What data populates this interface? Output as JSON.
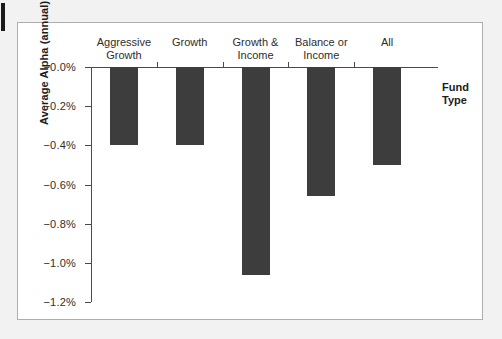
{
  "figure": {
    "y_axis_title": "Average Alpha (annual)",
    "x_axis_title": "Fund\nType"
  },
  "chart_data": {
    "type": "bar",
    "title": "",
    "subtitle": "",
    "xlabel": "Fund Type",
    "ylabel": "Average Alpha (annual)",
    "orientation": "vertical-downward",
    "baseline": 0.0,
    "grid": false,
    "legend": null,
    "bar_color": "#3d3d3d",
    "axis_color": "#4a4a4a",
    "categories": [
      "Aggressive Growth",
      "Growth",
      "Growth & Income",
      "Balance or Income",
      "All"
    ],
    "category_labels_wrapped": [
      "Aggressive\nGrowth",
      "Growth",
      "Growth &\nIncome",
      "Balance or\nIncome",
      "All"
    ],
    "values": [
      -0.4,
      -0.4,
      -1.06,
      -0.66,
      -0.5
    ],
    "value_unit": "percent",
    "ylim": [
      -1.2,
      0.0
    ],
    "ytick_values": [
      0.0,
      -0.2,
      -0.4,
      -0.6,
      -0.8,
      -1.0,
      -1.2
    ],
    "ytick_labels": [
      "−0.0%",
      "−0.2%",
      "−0.4%",
      "−0.6%",
      "−0.8%",
      "−1.0%",
      "−1.2%"
    ]
  }
}
